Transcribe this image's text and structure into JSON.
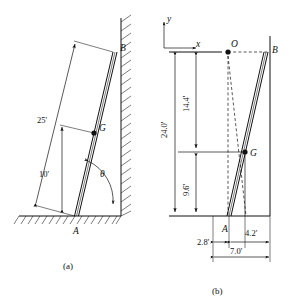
{
  "figure": {
    "captions": {
      "a": "(a)",
      "b": "(b)"
    },
    "colors": {
      "ink": "#111111",
      "background": "#ffffff"
    }
  },
  "panel_a": {
    "caption": "(a)",
    "description": "Ladder AB leaning against a vertical hatched wall, resting on hatched ground",
    "points": [
      {
        "name": "A",
        "label": "A",
        "role": "base-of-ladder-on-ground"
      },
      {
        "name": "B",
        "label": "B",
        "role": "top-of-ladder-at-wall"
      },
      {
        "name": "G",
        "label": "G",
        "role": "center-of-gravity"
      }
    ],
    "dimensions": [
      {
        "name": "ladder-length",
        "label": "25'",
        "value": 25,
        "unit": "ft",
        "from": "A",
        "to": "B"
      },
      {
        "name": "base-to-G",
        "label": "10'",
        "value": 10,
        "unit": "ft",
        "from": "A",
        "to": "G"
      }
    ],
    "angle": {
      "name": "theta",
      "label": "θ",
      "description": "angle between ladder and ground"
    },
    "surfaces": [
      {
        "name": "ground",
        "style": "hatched"
      },
      {
        "name": "wall",
        "style": "hatched"
      }
    ]
  },
  "panel_b": {
    "caption": "(b)",
    "description": "Coordinate-axis view of the ladder with instantaneous center O and dimensions",
    "axes": {
      "x_label": "x",
      "y_label": "y",
      "origin_corner": "top-left"
    },
    "points": [
      {
        "name": "O",
        "label": "O",
        "role": "instantaneous-center"
      },
      {
        "name": "A",
        "label": "A",
        "role": "base-of-ladder"
      },
      {
        "name": "B",
        "label": "B",
        "role": "top-of-ladder"
      },
      {
        "name": "G",
        "label": "G",
        "role": "center-of-gravity"
      }
    ],
    "vertical_dimensions": [
      {
        "name": "total-height",
        "label": "24.0'",
        "value": 24.0,
        "unit": "ft",
        "from": "baseline",
        "to": "O-level"
      },
      {
        "name": "upper-segment",
        "label": "14.4'",
        "value": 14.4,
        "unit": "ft",
        "from": "G-level",
        "to": "O-level"
      },
      {
        "name": "lower-segment",
        "label": "9.6'",
        "value": 9.6,
        "unit": "ft",
        "from": "baseline",
        "to": "G-level"
      }
    ],
    "horizontal_dimensions": [
      {
        "name": "offset-left",
        "label": "2.8'",
        "value": 2.8,
        "unit": "ft",
        "from": "left-reference",
        "to": "A"
      },
      {
        "name": "G-to-wall",
        "label": "4.2'",
        "value": 4.2,
        "unit": "ft",
        "from": "G-vertical",
        "to": "wall"
      },
      {
        "name": "total-width",
        "label": "7.0'",
        "value": 7.0,
        "unit": "ft",
        "from": "A",
        "to": "wall"
      }
    ],
    "construction_lines": [
      {
        "name": "O-to-B",
        "style": "dashed",
        "description": "horizontal dashed line from O to B"
      },
      {
        "name": "O-to-A",
        "style": "dashed",
        "description": "dashed line from O down to A"
      },
      {
        "name": "O-to-G-extended",
        "style": "dashed",
        "description": "dashed radius from O through G"
      }
    ]
  }
}
